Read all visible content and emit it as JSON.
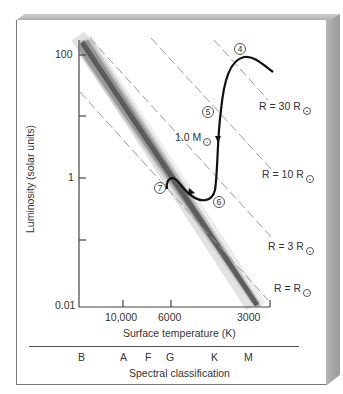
{
  "figure": {
    "y_axis": {
      "label": "Luminosity (solar units)",
      "ticks": [
        "100",
        "1",
        "0.01"
      ]
    },
    "x_axis": {
      "label": "Surface temperature (K)",
      "ticks": [
        "10,000",
        "6000",
        "3000"
      ]
    },
    "spectral": {
      "label": "Spectral classification",
      "classes": [
        "B",
        "A",
        "F",
        "G",
        "K",
        "M"
      ]
    },
    "radius_lines": [
      {
        "label": "R = 30 R",
        "symbol": "sun"
      },
      {
        "label": "R = 10 R",
        "symbol": "sun"
      },
      {
        "label": "R = 3 R",
        "symbol": "sun"
      },
      {
        "label": "R = R",
        "symbol": "sun"
      }
    ],
    "mass_label": "1.0 M",
    "stages": [
      "4",
      "5",
      "6",
      "7"
    ]
  },
  "colors": {
    "axis": "#444444",
    "track": "#111111",
    "dashed": "#9a9a9a",
    "main_sequence": "#222222",
    "frame": "#a9a9a9"
  }
}
